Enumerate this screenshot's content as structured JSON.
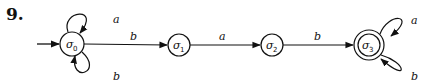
{
  "problem_number": "9.",
  "states": [
    {
      "id": "s0",
      "name": "σ",
      "sub": "0",
      "cx": 72,
      "cy": 44,
      "start": true,
      "accepting": false
    },
    {
      "id": "s1",
      "name": "σ",
      "sub": "1",
      "cx": 179,
      "cy": 45,
      "start": false,
      "accepting": false
    },
    {
      "id": "s2",
      "name": "σ",
      "sub": "2",
      "cx": 272,
      "cy": 45,
      "start": false,
      "accepting": false
    },
    {
      "id": "s3",
      "name": "σ",
      "sub": "3",
      "cx": 369,
      "cy": 45,
      "start": false,
      "accepting": true
    }
  ],
  "transitions": [
    {
      "from": "s0",
      "to": "s0",
      "label": "a",
      "loop": "top"
    },
    {
      "from": "s0",
      "to": "s0",
      "label": "b",
      "loop": "bottom"
    },
    {
      "from": "s0",
      "to": "s1",
      "label": "b"
    },
    {
      "from": "s1",
      "to": "s2",
      "label": "a"
    },
    {
      "from": "s2",
      "to": "s3",
      "label": "b"
    },
    {
      "from": "s3",
      "to": "s3",
      "label": "a",
      "loop": "top"
    },
    {
      "from": "s3",
      "to": "s3",
      "label": "b",
      "loop": "bottom"
    }
  ],
  "labels": {
    "s0_loop_top": "a",
    "s0_loop_bottom": "b",
    "s0_s1": "b",
    "s1_s2": "a",
    "s2_s3": "b",
    "s3_loop_top": "a",
    "s3_loop_bottom": "b",
    "s0_name": "σ",
    "s0_sub": "0",
    "s1_name": "σ",
    "s1_sub": "1",
    "s2_name": "σ",
    "s2_sub": "2",
    "s3_name": "σ",
    "s3_sub": "3"
  }
}
